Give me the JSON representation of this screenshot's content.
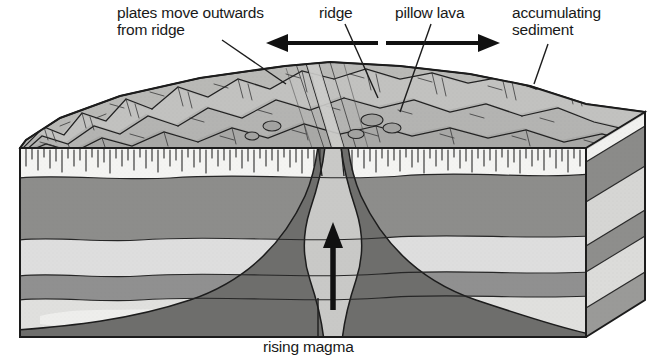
{
  "diagram": {
    "type": "geological block diagram",
    "labels": {
      "plates": "plates move outwards\nfrom ridge",
      "ridge": "ridge",
      "pillow_lava": "pillow lava",
      "sediment": "accumulating\nsediment",
      "magma": "rising magma"
    },
    "arrows": {
      "left_spreading": "left-pointing spreading arrow",
      "right_spreading": "right-pointing spreading arrow",
      "magma_up": "upward rising magma arrow"
    },
    "colors": {
      "background": "#ffffff",
      "ink": "#191919",
      "seafloor_surface": "#b6b6b6",
      "sediment_layer": "#f2f2f0",
      "crust_dark": "#8e8e8e",
      "crust_light": "#d8d8d6",
      "magma_body": "#6f6f6f",
      "magma_conduit": "#c6c6c4",
      "side_face_dark": "#7d7d7d",
      "side_face_light": "#cfcfcd"
    },
    "layers": [
      {
        "name": "accumulating sediment",
        "tone": "light"
      },
      {
        "name": "upper crust band",
        "tone": "medium"
      },
      {
        "name": "middle light band",
        "tone": "light"
      },
      {
        "name": "lower medium band",
        "tone": "medium"
      },
      {
        "name": "basal light band",
        "tone": "light"
      },
      {
        "name": "rising magma body",
        "tone": "dark"
      }
    ]
  }
}
